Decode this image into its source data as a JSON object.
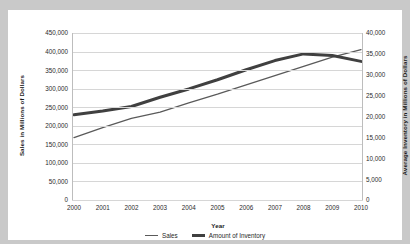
{
  "chart_data": {
    "type": "line",
    "title": "",
    "xlabel": "Year",
    "ylabel": "Sales in Millions of Dollars",
    "y2label": "Average Inventory in Millions of Dollars",
    "categories": [
      "2000",
      "2001",
      "2002",
      "2003",
      "2004",
      "2005",
      "2006",
      "2007",
      "2008",
      "2009",
      "2010"
    ],
    "x": [
      2000,
      2001,
      2002,
      2003,
      2004,
      2005,
      2006,
      2007,
      2008,
      2009,
      2010
    ],
    "ylim": [
      0,
      450000
    ],
    "y2lim": [
      0,
      40000
    ],
    "ytick_labels": [
      "0",
      "50,000",
      "100,000",
      "150,000",
      "200,000",
      "250,000",
      "300,000",
      "350,000",
      "400,000",
      "450,000"
    ],
    "ytick_values": [
      0,
      50000,
      100000,
      150000,
      200000,
      250000,
      300000,
      350000,
      400000,
      450000
    ],
    "y2tick_labels": [
      "0",
      "5,000",
      "10,000",
      "15,000",
      "20,000",
      "25,000",
      "30,000",
      "35,000",
      "40,000"
    ],
    "y2tick_values": [
      0,
      5000,
      10000,
      15000,
      20000,
      25000,
      30000,
      35000,
      40000
    ],
    "grid": true,
    "legend_position": "bottom",
    "series": [
      {
        "name": "Sales",
        "axis": "left",
        "color": "#5a5a5a",
        "width": 1.3,
        "values": [
          168000,
          195000,
          220000,
          237000,
          262000,
          285000,
          310000,
          335000,
          360000,
          385000,
          405000
        ]
      },
      {
        "name": "Amount of Inventory",
        "axis": "right",
        "color": "#404040",
        "width": 3,
        "values": [
          20400,
          21300,
          22400,
          24600,
          26600,
          28800,
          31200,
          33400,
          35000,
          34600,
          33200
        ]
      }
    ]
  },
  "axes": {
    "x_title": "Year",
    "y_left_title": "Sales in Millions of Dollars",
    "y_right_title": "Average Inventory in Millions of Dollars"
  },
  "legend": {
    "items": [
      {
        "label": "Sales",
        "style": "thin"
      },
      {
        "label": "Amount of Inventory",
        "style": "thick"
      }
    ]
  }
}
